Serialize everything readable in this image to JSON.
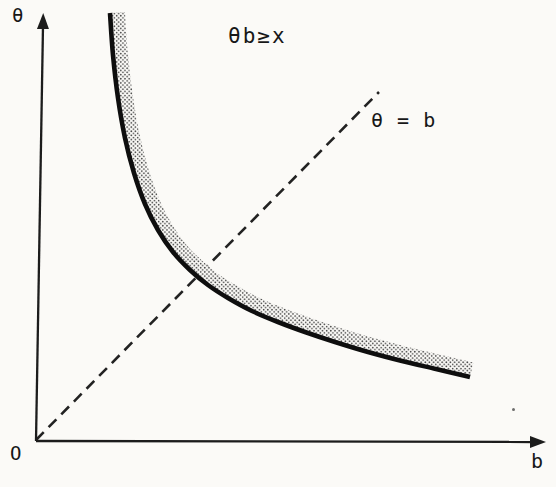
{
  "figure": {
    "labels": {
      "y_axis": "θ",
      "x_axis": "b",
      "origin": "O",
      "region": "θb≥x",
      "identity_line": "θ = b"
    },
    "colors": {
      "paper": "#fbfaf7",
      "ink": "#1c1c1c",
      "curve": "#0e0e0e",
      "dash": "#222222",
      "stipple": "#3d3d3d"
    }
  },
  "chart_data": {
    "type": "line",
    "title": "",
    "xlabel": "b",
    "ylabel": "θ",
    "note": "Schematic sketch without numeric tick values; coordinates below are page pixels (y grows downward).",
    "annotations": [
      {
        "text": "θb≥x",
        "meaning": "stippled band marks boundary region θb ≥ x above the hyperbola"
      },
      {
        "text": "θ = b",
        "meaning": "dashed 45-degree identity line from the origin"
      }
    ],
    "axes": {
      "origin_px": [
        36,
        441
      ],
      "x_axis_end_px": [
        533,
        442
      ],
      "y_axis_end_px": [
        43,
        26
      ],
      "ticks": "none",
      "grid": false
    },
    "series": [
      {
        "name": "hyperbola boundary θb = x",
        "style": "solid-thick",
        "points_px": [
          [
            110,
            13
          ],
          [
            113,
            55
          ],
          [
            118,
            98
          ],
          [
            125,
            138
          ],
          [
            134,
            173
          ],
          [
            145,
            204
          ],
          [
            158,
            230
          ],
          [
            173,
            252
          ],
          [
            190,
            270
          ],
          [
            208,
            285
          ],
          [
            228,
            298
          ],
          [
            252,
            311
          ],
          [
            278,
            322
          ],
          [
            305,
            332
          ],
          [
            335,
            342
          ],
          [
            368,
            352
          ],
          [
            402,
            361
          ],
          [
            436,
            369
          ],
          [
            470,
            377
          ]
        ]
      },
      {
        "name": "identity line θ = b",
        "style": "dashed",
        "points_px": [
          [
            36,
            440
          ],
          [
            379,
            92
          ]
        ]
      }
    ],
    "band": {
      "offset_px": 15,
      "side": "above-right of curve",
      "texture": "halftone stipple dots"
    }
  }
}
